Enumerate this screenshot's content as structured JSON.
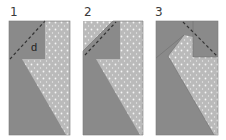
{
  "diagram": {
    "type": "sewing-fold-steps",
    "colors": {
      "dark_fabric": "#8a8a8a",
      "light_fabric": "#b9b9b9",
      "dots": "#ffffff",
      "dashed_line": "#3a3a3a",
      "outline": "#6e6e6e"
    },
    "steps": [
      {
        "number": "1",
        "label": "d"
      },
      {
        "number": "2"
      },
      {
        "number": "3"
      }
    ]
  }
}
